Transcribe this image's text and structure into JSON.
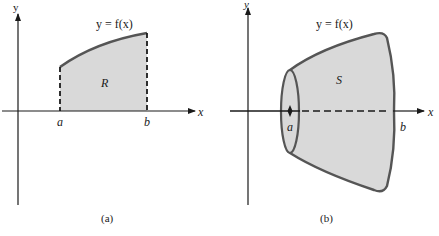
{
  "colors": {
    "ink": "#1a1a1a",
    "curve": "#555555",
    "fill": "#d9d9d9",
    "background": "#ffffff"
  },
  "panel_a": {
    "caption": "(a)",
    "function_label": "y = f(x)",
    "region_label": "R",
    "x_axis_label": "x",
    "y_axis_label": "y",
    "tick_a": "a",
    "tick_b": "b"
  },
  "panel_b": {
    "caption": "(b)",
    "function_label": "y = f(x)",
    "solid_label": "S",
    "x_axis_label": "x",
    "y_axis_label": "y",
    "tick_a": "a",
    "tick_b": "b"
  }
}
